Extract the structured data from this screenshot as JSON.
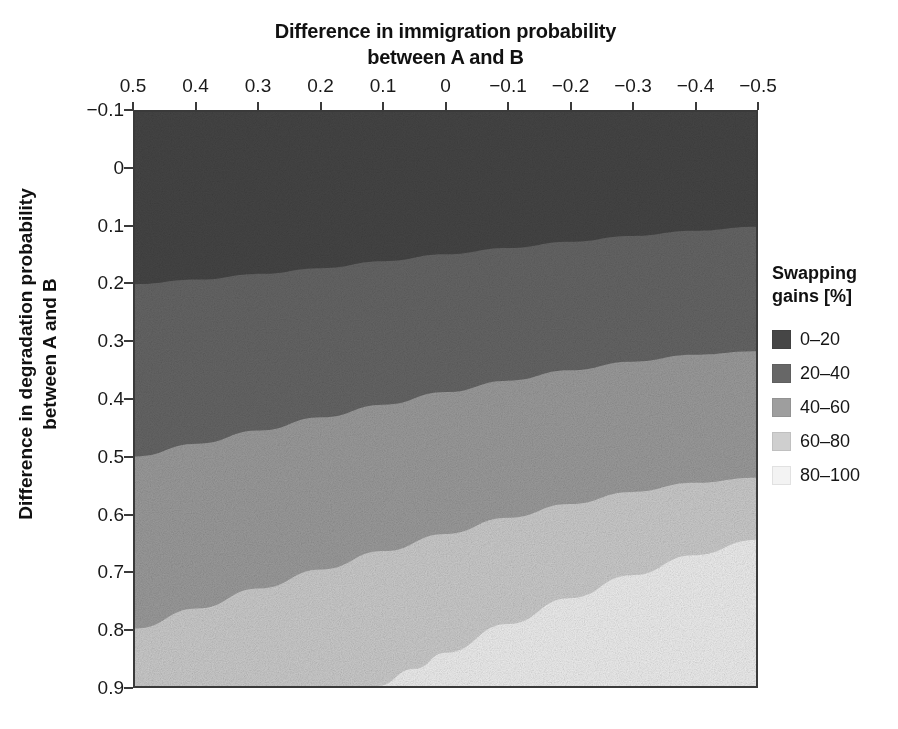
{
  "chart_data": {
    "type": "heatmap",
    "title": "",
    "xlabel": "Difference in immigration probability between A and B",
    "xlabel_lines": [
      "Difference in immigration probability",
      "between A and B"
    ],
    "ylabel": "Difference in degradation probability between A and B",
    "ylabel_lines": [
      "Difference in degradation probability",
      "between A and B"
    ],
    "x_tick_labels": [
      "0.5",
      "0.4",
      "0.3",
      "0.2",
      "0.1",
      "0",
      "−0.1",
      "−0.2",
      "−0.3",
      "−0.4",
      "−0.5"
    ],
    "x_tick_values": [
      0.5,
      0.4,
      0.3,
      0.2,
      0.1,
      0,
      -0.1,
      -0.2,
      -0.3,
      -0.4,
      -0.5
    ],
    "xlim": [
      0.5,
      -0.5
    ],
    "x_axis_position": "top",
    "x_axis_reversed": true,
    "y_tick_labels": [
      "−0.1",
      "0",
      "0.1",
      "0.2",
      "0.3",
      "0.4",
      "0.5",
      "0.6",
      "0.7",
      "0.8",
      "0.9"
    ],
    "y_tick_values": [
      -0.1,
      0,
      0.1,
      0.2,
      0.3,
      0.4,
      0.5,
      0.6,
      0.7,
      0.8,
      0.9
    ],
    "ylim": [
      -0.1,
      0.9
    ],
    "y_axis_inverted": true,
    "grid": false,
    "legend_position": "right",
    "legend_title": "Swapping gains [%]",
    "legend_title_lines": [
      "Swapping",
      "gains [%]"
    ],
    "bands": [
      {
        "label": "0–20",
        "range": [
          0,
          20
        ],
        "color": "#464646"
      },
      {
        "label": "20–40",
        "range": [
          20,
          40
        ],
        "color": "#676767"
      },
      {
        "label": "40–60",
        "range": [
          40,
          60
        ],
        "color": "#9e9e9e"
      },
      {
        "label": "60–80",
        "range": [
          60,
          80
        ],
        "color": "#cfcfcf"
      },
      {
        "label": "80–100",
        "range": [
          80,
          100
        ],
        "color": "#f3f3f3"
      }
    ],
    "contour_boundaries": [
      {
        "between": "0–20 / 20–40",
        "level": 20,
        "points": [
          [
            0.5,
            0.2
          ],
          [
            0.4,
            0.192
          ],
          [
            0.3,
            0.182
          ],
          [
            0.2,
            0.172
          ],
          [
            0.1,
            0.16
          ],
          [
            0.0,
            0.148
          ],
          [
            -0.1,
            0.137
          ],
          [
            -0.2,
            0.126
          ],
          [
            -0.3,
            0.116
          ],
          [
            -0.4,
            0.107
          ],
          [
            -0.5,
            0.1
          ]
        ]
      },
      {
        "between": "20–40 / 40–60",
        "level": 40,
        "points": [
          [
            0.5,
            0.5
          ],
          [
            0.4,
            0.478
          ],
          [
            0.3,
            0.455
          ],
          [
            0.2,
            0.432
          ],
          [
            0.1,
            0.41
          ],
          [
            0.0,
            0.388
          ],
          [
            -0.1,
            0.368
          ],
          [
            -0.2,
            0.35
          ],
          [
            -0.3,
            0.335
          ],
          [
            -0.4,
            0.323
          ],
          [
            -0.5,
            0.317
          ]
        ]
      },
      {
        "between": "40–60 / 60–80",
        "level": 60,
        "points": [
          [
            0.5,
            0.8
          ],
          [
            0.4,
            0.765
          ],
          [
            0.3,
            0.73
          ],
          [
            0.2,
            0.697
          ],
          [
            0.1,
            0.665
          ],
          [
            0.0,
            0.635
          ],
          [
            -0.1,
            0.607
          ],
          [
            -0.2,
            0.583
          ],
          [
            -0.3,
            0.562
          ],
          [
            -0.4,
            0.546
          ],
          [
            -0.5,
            0.537
          ]
        ]
      },
      {
        "between": "60–80 / 80–100",
        "level": 80,
        "points": [
          [
            0.11,
            0.9
          ],
          [
            0.05,
            0.87
          ],
          [
            0.0,
            0.842
          ],
          [
            -0.1,
            0.792
          ],
          [
            -0.2,
            0.747
          ],
          [
            -0.3,
            0.707
          ],
          [
            -0.4,
            0.672
          ],
          [
            -0.5,
            0.645
          ]
        ]
      }
    ]
  },
  "legend": {
    "title_lines": [
      "Swapping",
      "gains [%]"
    ],
    "items": [
      {
        "label": "0–20",
        "color": "#464646"
      },
      {
        "label": "20–40",
        "color": "#676767"
      },
      {
        "label": "40–60",
        "color": "#9e9e9e"
      },
      {
        "label": "60–80",
        "color": "#cfcfcf"
      },
      {
        "label": "80–100",
        "color": "#f3f3f3"
      }
    ]
  },
  "axes": {
    "x_title_line1": "Difference in immigration probability",
    "x_title_line2": "between A and B",
    "y_title_line1": "Difference in degradation probability",
    "y_title_line2": "between A and B"
  }
}
